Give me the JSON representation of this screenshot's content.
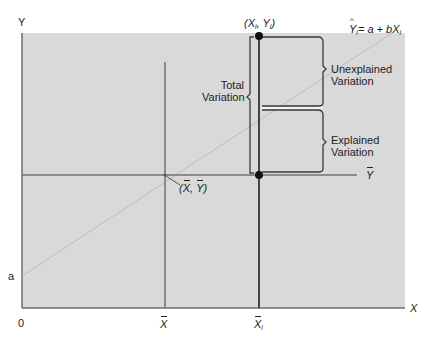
{
  "diagram": {
    "type": "regression-variation-decomposition",
    "colors": {
      "panel_background": "#d9d9d9",
      "axis_line": "#6e6e6e",
      "mean_line": "#707070",
      "xi_line": "#333333",
      "regression_line": "#bdbdbd",
      "bracket_line": "#3a3a3a",
      "point_fill": "#111111",
      "text": "#222222"
    },
    "axes": {
      "y_label": "Y",
      "x_label": "X",
      "origin_label": "0",
      "intercept_label": "a"
    },
    "x_ticks": {
      "mean_x": "X",
      "x_i": "X",
      "x_i_subscript": "i"
    },
    "mean_y_label": "Y",
    "centroid_label": {
      "open": "(",
      "x": "X",
      "sep": ", ",
      "y": "Y",
      "close": ")"
    },
    "observation_label": {
      "open": "(",
      "x": "X",
      "x_sub": "i",
      "sep": ", ",
      "y": "Y",
      "y_sub": "i",
      "close": ")"
    },
    "regression_equation": {
      "lhs": "Y",
      "lhs_sub": "i",
      "rhs": "= a + bX",
      "rhs_sub": "i"
    },
    "brackets": {
      "total": [
        "Total",
        "Variation"
      ],
      "unexplained": [
        "Unexplained",
        "Variation"
      ],
      "explained": [
        "Explained",
        "Variation"
      ]
    }
  }
}
